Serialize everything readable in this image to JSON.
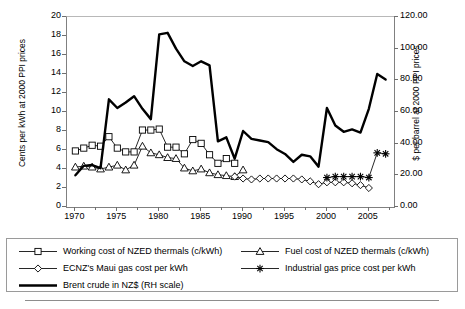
{
  "chart_data": {
    "type": "line",
    "title": "",
    "xlabel": "",
    "ylabel": "Cents per kWh at 2000 PPI prices",
    "ylabel_right": "$ per barrel at 2000 PPI prices",
    "xlim": [
      1969,
      2008
    ],
    "ylim": [
      0,
      20
    ],
    "ylim_right": [
      0,
      120
    ],
    "grid": false,
    "legend_position": "below",
    "xticks": [
      1970,
      1975,
      1980,
      1985,
      1990,
      1995,
      2000,
      2005
    ],
    "xtick_labels": [
      "1970",
      "1975",
      "1980",
      "1985",
      "1990",
      "1995",
      "2000",
      "2005"
    ],
    "yticks": [
      0,
      2,
      4,
      6,
      8,
      10,
      12,
      14,
      16,
      18,
      20
    ],
    "ytick_labels": [
      "0",
      "2",
      "4",
      "6",
      "8",
      "10",
      "12",
      "14",
      "16",
      "18",
      "20"
    ],
    "yticks_right": [
      0,
      20,
      40,
      60,
      80,
      100,
      120
    ],
    "ytick_labels_right": [
      "0.00",
      "20.00",
      "40.00",
      "60.00",
      "80.00",
      "100.00",
      "120.00"
    ],
    "series": [
      {
        "name": "Working cost of NZED thermals (c/kWh)",
        "marker": "square",
        "axis": "left",
        "x": [
          1970,
          1971,
          1972,
          1973,
          1974,
          1975,
          1976,
          1977,
          1978,
          1979,
          1980,
          1981,
          1982,
          1983,
          1984,
          1985,
          1986,
          1987,
          1988,
          1989
        ],
        "values": [
          5.9,
          6.2,
          6.5,
          6.4,
          7.4,
          6.2,
          5.8,
          5.8,
          8.1,
          8.1,
          8.2,
          6.3,
          6.3,
          5.6,
          7.1,
          6.7,
          5.5,
          4.6,
          5.1,
          4.6
        ]
      },
      {
        "name": "Fuel cost of NZED thermals (c/kWh)",
        "marker": "triangle",
        "axis": "left",
        "x": [
          1970,
          1971,
          1972,
          1973,
          1974,
          1975,
          1976,
          1977,
          1978,
          1979,
          1980,
          1981,
          1982,
          1983,
          1984,
          1985,
          1986,
          1987,
          1988,
          1989,
          1990
        ],
        "values": [
          4.2,
          4.3,
          4.2,
          4.0,
          4.2,
          4.4,
          3.9,
          4.4,
          6.4,
          5.7,
          5.5,
          5.2,
          5.1,
          4.1,
          3.8,
          4.0,
          3.6,
          3.4,
          3.3,
          3.2,
          3.9
        ]
      },
      {
        "name": "ECNZ's Maui gas cost per kWh",
        "marker": "diamond",
        "axis": "left",
        "x": [
          1989,
          1990,
          1991,
          1992,
          1993,
          1994,
          1995,
          1996,
          1997,
          1998,
          1999,
          2000,
          2001,
          2002,
          2003,
          2004,
          2005
        ],
        "values": [
          3.2,
          3.0,
          2.9,
          3.0,
          3.0,
          3.0,
          3.0,
          3.0,
          2.9,
          2.7,
          2.4,
          2.6,
          2.6,
          2.6,
          2.5,
          2.3,
          2.0
        ]
      },
      {
        "name": "Industrial gas price cost per kWh",
        "marker": "asterisk",
        "axis": "left",
        "x": [
          2000,
          2001,
          2002,
          2003,
          2004,
          2005,
          2006,
          2007
        ],
        "values": [
          3.1,
          3.2,
          3.2,
          3.2,
          3.2,
          3.1,
          5.7,
          5.6
        ]
      },
      {
        "name": "Brent crude in NZ$ (RH scale)",
        "marker": "none",
        "axis": "right",
        "x": [
          1970,
          1971,
          1972,
          1973,
          1974,
          1975,
          1976,
          1977,
          1978,
          1979,
          1980,
          1981,
          1982,
          1983,
          1984,
          1985,
          1986,
          1987,
          1988,
          1989,
          1990,
          1991,
          1992,
          1993,
          1994,
          1995,
          1996,
          1997,
          1998,
          1999,
          2000,
          2001,
          2002,
          2003,
          2004,
          2005,
          2006,
          2007
        ],
        "values": [
          20.0,
          26.0,
          26.5,
          24.5,
          68.0,
          62.5,
          66.0,
          70.0,
          62.0,
          55.5,
          109.0,
          110.0,
          100.0,
          92.0,
          89.0,
          92.0,
          89.5,
          41.5,
          44.0,
          30.5,
          48.0,
          43.0,
          42.0,
          41.0,
          36.5,
          33.5,
          28.5,
          33.0,
          32.0,
          25.5,
          62.5,
          51.5,
          47.5,
          49.0,
          47.0,
          62.0,
          84.0,
          80.5
        ]
      }
    ],
    "annotations": []
  },
  "legend": {
    "items": [
      {
        "label": "Working cost of NZED thermals (c/kWh)",
        "marker": "square"
      },
      {
        "label": "Fuel cost of NZED thermals (c/kWh)",
        "marker": "triangle"
      },
      {
        "label": "ECNZ's Maui gas cost per kWh",
        "marker": "diamond"
      },
      {
        "label": "Industrial gas price cost per kWh",
        "marker": "asterisk"
      },
      {
        "label": "Brent crude in NZ$ (RH scale)",
        "marker": "thick-line"
      }
    ]
  }
}
